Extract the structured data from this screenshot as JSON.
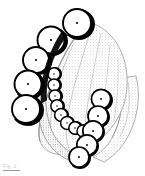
{
  "figure": {
    "background_color": "#ffffff",
    "ink_color": "#000000",
    "stipple_color": "#b7b7b7",
    "shadow_color": "#000000",
    "outline_color": "#111111",
    "width": 145,
    "height": 176
  },
  "caption": {
    "label": "Fig.",
    "number": "1",
    "visible_text": "Fig. 1"
  },
  "dome": {
    "name": "stippled-palate-dome",
    "fill": "#f2f2f2",
    "stroke": "#9b9b9b",
    "ridge_count": 5
  },
  "base": {
    "name": "arch-base-band",
    "fill": "#efefef",
    "stroke": "#8d8d8d"
  },
  "arches": [
    {
      "id": "left-arch",
      "label": "Left posterior arch",
      "unit_count": 5,
      "radius": 13.5,
      "units": [
        {
          "cx": 79,
          "cy": 23,
          "r": 14.0
        },
        {
          "cx": 53,
          "cy": 40,
          "r": 13.5
        },
        {
          "cx": 38,
          "cy": 60,
          "r": 13.0
        },
        {
          "cx": 30,
          "cy": 84,
          "r": 13.5
        },
        {
          "cx": 28,
          "cy": 109,
          "r": 14.0
        }
      ]
    },
    {
      "id": "inner-arch",
      "label": "Inner lingual arch",
      "unit_count": 8,
      "radius": 6.0,
      "units": [
        {
          "cx": 57,
          "cy": 74,
          "r": 6.2
        },
        {
          "cx": 57,
          "cy": 85,
          "r": 6.0
        },
        {
          "cx": 58,
          "cy": 96,
          "r": 6.0
        },
        {
          "cx": 60,
          "cy": 106,
          "r": 6.2
        },
        {
          "cx": 64,
          "cy": 115,
          "r": 6.4
        },
        {
          "cx": 70,
          "cy": 123,
          "r": 6.4
        },
        {
          "cx": 78,
          "cy": 128,
          "r": 6.2
        },
        {
          "cx": 86,
          "cy": 131,
          "r": 6.0
        }
      ]
    },
    {
      "id": "right-arch",
      "label": "Right posterior arch",
      "unit_count": 5,
      "radius": 10.0,
      "units": [
        {
          "cx": 104,
          "cy": 99,
          "r": 9.6
        },
        {
          "cx": 101,
          "cy": 116,
          "r": 10.0
        },
        {
          "cx": 96,
          "cy": 131,
          "r": 10.2
        },
        {
          "cx": 90,
          "cy": 145,
          "r": 10.2
        },
        {
          "cx": 82,
          "cy": 157,
          "r": 10.0
        }
      ]
    }
  ]
}
